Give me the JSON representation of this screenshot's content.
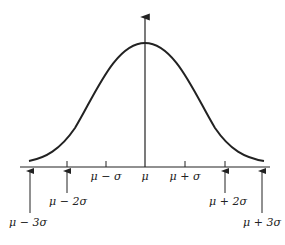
{
  "diagram": {
    "labels": [
      {
        "id": "m3",
        "text": "μ − 3σ",
        "x": 29,
        "y": 213
      },
      {
        "id": "m2",
        "text": "μ − 2σ",
        "x": 68,
        "y": 187
      },
      {
        "id": "m1",
        "text": "μ − σ",
        "x": 106,
        "y": 172
      },
      {
        "id": "mu",
        "text": "μ",
        "x": 145,
        "y": 172
      },
      {
        "id": "p1",
        "text": "μ + σ",
        "x": 185,
        "y": 172
      },
      {
        "id": "p2",
        "text": "μ + 2σ",
        "x": 226,
        "y": 187
      },
      {
        "id": "p3",
        "text": "μ + 3σ",
        "x": 265,
        "y": 213
      }
    ]
  }
}
